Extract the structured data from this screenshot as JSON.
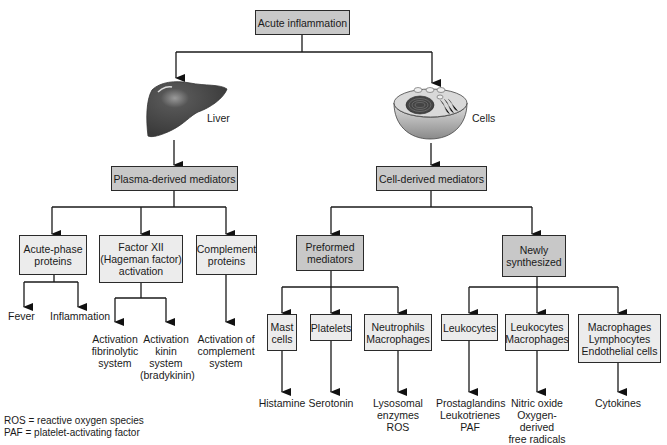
{
  "root": {
    "label": "Acute inflammation"
  },
  "sources": {
    "liver": {
      "label": "Liver",
      "icon": "liver-icon"
    },
    "cells": {
      "label": "Cells",
      "icon": "cell-icon"
    }
  },
  "plasma": {
    "label": "Plasma-derived mediators",
    "children": [
      {
        "label": "Acute-phase\nproteins",
        "outcomes": [
          "Fever",
          "Inflammation"
        ]
      },
      {
        "label": "Factor XII\n(Hageman factor)\nactivation",
        "outcomes": [
          "Activation\nfibrinolytic\nsystem",
          "Activation\nkinin\nsystem\n(bradykinin)"
        ]
      },
      {
        "label": "Complement\nproteins",
        "outcomes": [
          "Activation of\ncomplement\nsystem"
        ]
      }
    ]
  },
  "cell": {
    "label": "Cell-derived mediators",
    "preformed": {
      "label": "Preformed\nmediators",
      "children": [
        {
          "label": "Mast\ncells",
          "outcome": "Histamine"
        },
        {
          "label": "Platelets",
          "outcome": "Serotonin"
        },
        {
          "label": "Neutrophils\nMacrophages",
          "outcome": "Lysosomal\nenzymes\nROS"
        }
      ]
    },
    "newly": {
      "label": "Newly\nsynthesized",
      "children": [
        {
          "label": "Leukocytes",
          "outcome": "Prostaglandins\nLeukotrienes\nPAF"
        },
        {
          "label": "Leukocytes\nMacrophages",
          "outcome": "Nitric oxide\nOxygen-\nderived\nfree radicals"
        },
        {
          "label": "Macrophages\nLymphocytes\nEndothelial cells",
          "outcome": "Cytokines"
        }
      ]
    }
  },
  "legend": [
    "ROS = reactive oxygen species",
    "PAF = platelet-activating factor"
  ],
  "colors": {
    "dark_box": "#c8c8c8",
    "light_box": "#ececec",
    "line": "#1a1a1a"
  }
}
